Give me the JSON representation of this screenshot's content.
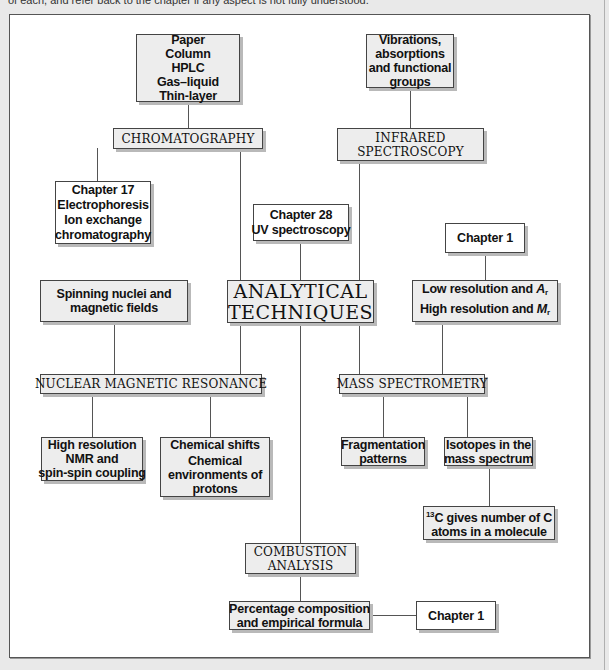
{
  "caption": "of each, and refer back to the chapter if any aspect is not fully understood.",
  "diagram": {
    "center": {
      "lines": [
        "ANALYTICAL",
        "TECHNIQUES"
      ]
    },
    "chromatography": {
      "label": "CHROMATOGRAPHY",
      "types": [
        "Paper",
        "Column",
        "HPLC",
        "Gas–liquid",
        "Thin-layer"
      ],
      "related": [
        "Chapter 17",
        "Electrophoresis",
        "Ion exchange",
        "chromatography"
      ]
    },
    "infrared": {
      "label_lines": [
        "INFRARED",
        "SPECTROSCOPY"
      ],
      "detail": [
        "Vibrations,",
        "absorptions",
        "and functional",
        "groups"
      ]
    },
    "uv": {
      "lines": [
        "Chapter 28",
        "UV spectroscopy"
      ]
    },
    "nmr": {
      "label": "NUCLEAR MAGNETIC RESONANCE",
      "basis": [
        "Spinning nuclei and",
        "magnetic fields"
      ],
      "high_res": [
        "High resolution",
        "NMR and",
        "spin-spin coupling"
      ],
      "shifts": [
        "Chemical shifts",
        "Chemical",
        "environments of",
        "protons"
      ]
    },
    "mass_spec": {
      "label": "MASS SPECTROMETRY",
      "chapter": "Chapter 1",
      "resolution": {
        "low": "Low resolution and ",
        "low_sym": "A",
        "low_sub": "r",
        "high": "High resolution and ",
        "high_sym": "M",
        "high_sub": "r"
      },
      "fragmentation": [
        "Fragmentation",
        "patterns"
      ],
      "isotopes": [
        "Isotopes in the",
        "mass spectrum"
      ],
      "c13": {
        "sup": "13",
        "line1": "C gives number of C",
        "line2": "atoms in a molecule"
      }
    },
    "combustion": {
      "label_lines": [
        "COMBUSTION",
        "ANALYSIS"
      ],
      "result": [
        "Percentage composition",
        "and empirical formula"
      ],
      "chapter": "Chapter 1"
    }
  },
  "colors": {
    "box_fill": "#ededed",
    "border": "#444444",
    "shadow": "#b9b9b9",
    "background": "#e9e9e9"
  }
}
